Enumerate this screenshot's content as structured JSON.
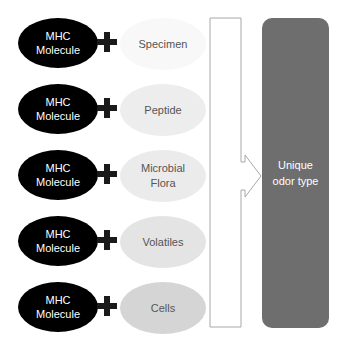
{
  "diagram": {
    "rows": [
      {
        "mhc_line1": "MHC",
        "mhc_line2": "Molecule",
        "factor_line1": "Specimen",
        "factor_line2": "",
        "factor_color": "#f8f8f8"
      },
      {
        "mhc_line1": "MHC",
        "mhc_line2": "Molecule",
        "factor_line1": "Peptide",
        "factor_line2": "",
        "factor_color": "#ededed"
      },
      {
        "mhc_line1": "MHC",
        "mhc_line2": "Molecule",
        "factor_line1": "Microbial",
        "factor_line2": "Flora",
        "factor_color": "#ebebeb"
      },
      {
        "mhc_line1": "MHC",
        "mhc_line2": "Molecule",
        "factor_line1": "Volatiles",
        "factor_line2": "",
        "factor_color": "#e4e4e4"
      },
      {
        "mhc_line1": "MHC",
        "mhc_line2": "Molecule",
        "factor_line1": "Cells",
        "factor_line2": "",
        "factor_color": "#d5d5d5"
      }
    ],
    "result": {
      "line1": "Unique",
      "line2": "odor type",
      "color": "#6e6e6e"
    },
    "arrow": {
      "stroke_color": "#a8a8a8"
    }
  }
}
